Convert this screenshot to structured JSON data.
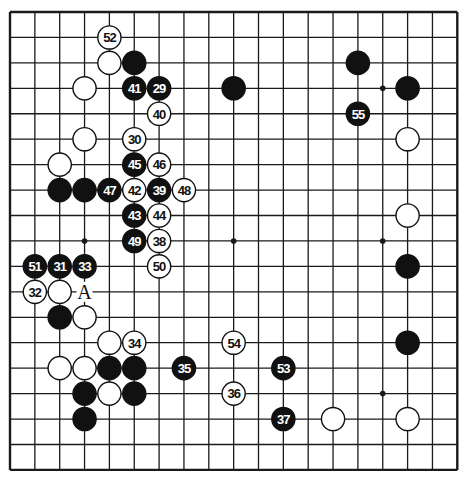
{
  "board": {
    "size": 19,
    "origin_x": 10,
    "origin_y": 12,
    "spacing_x": 24.85,
    "spacing_y": 25.44,
    "line_color": "#1a1a1a",
    "background": "#ffffff",
    "black_color": "#111111",
    "white_color": "#ffffff",
    "hoshi": [
      [
        3,
        3
      ],
      [
        9,
        3
      ],
      [
        15,
        3
      ],
      [
        3,
        9
      ],
      [
        9,
        9
      ],
      [
        15,
        9
      ],
      [
        3,
        15
      ],
      [
        9,
        15
      ],
      [
        15,
        15
      ]
    ]
  },
  "stones": [
    {
      "col": 4,
      "row": 1,
      "color": "white",
      "label": "52"
    },
    {
      "col": 4,
      "row": 2,
      "color": "white",
      "label": ""
    },
    {
      "col": 5,
      "row": 2,
      "color": "black",
      "label": ""
    },
    {
      "col": 3,
      "row": 3,
      "color": "white",
      "label": ""
    },
    {
      "col": 5,
      "row": 3,
      "color": "black",
      "label": "41"
    },
    {
      "col": 6,
      "row": 3,
      "color": "black",
      "label": "29"
    },
    {
      "col": 9,
      "row": 3,
      "color": "black",
      "label": ""
    },
    {
      "col": 6,
      "row": 4,
      "color": "white",
      "label": "40"
    },
    {
      "col": 3,
      "row": 5,
      "color": "white",
      "label": ""
    },
    {
      "col": 5,
      "row": 5,
      "color": "white",
      "label": "30"
    },
    {
      "col": 2,
      "row": 6,
      "color": "white",
      "label": ""
    },
    {
      "col": 5,
      "row": 6,
      "color": "black",
      "label": "45"
    },
    {
      "col": 6,
      "row": 6,
      "color": "white",
      "label": "46"
    },
    {
      "col": 2,
      "row": 7,
      "color": "black",
      "label": ""
    },
    {
      "col": 3,
      "row": 7,
      "color": "black",
      "label": ""
    },
    {
      "col": 4,
      "row": 7,
      "color": "black",
      "label": "47"
    },
    {
      "col": 5,
      "row": 7,
      "color": "white",
      "label": "42"
    },
    {
      "col": 6,
      "row": 7,
      "color": "black",
      "label": "39"
    },
    {
      "col": 7,
      "row": 7,
      "color": "white",
      "label": "48"
    },
    {
      "col": 5,
      "row": 8,
      "color": "black",
      "label": "43"
    },
    {
      "col": 6,
      "row": 8,
      "color": "white",
      "label": "44"
    },
    {
      "col": 5,
      "row": 9,
      "color": "black",
      "label": "49"
    },
    {
      "col": 6,
      "row": 9,
      "color": "white",
      "label": "38"
    },
    {
      "col": 1,
      "row": 10,
      "color": "black",
      "label": "51"
    },
    {
      "col": 2,
      "row": 10,
      "color": "black",
      "label": "31"
    },
    {
      "col": 3,
      "row": 10,
      "color": "black",
      "label": "33"
    },
    {
      "col": 6,
      "row": 10,
      "color": "white",
      "label": "50"
    },
    {
      "col": 1,
      "row": 11,
      "color": "white",
      "label": "32"
    },
    {
      "col": 2,
      "row": 11,
      "color": "white",
      "label": ""
    },
    {
      "col": 2,
      "row": 12,
      "color": "black",
      "label": ""
    },
    {
      "col": 3,
      "row": 12,
      "color": "white",
      "label": ""
    },
    {
      "col": 4,
      "row": 13,
      "color": "white",
      "label": ""
    },
    {
      "col": 5,
      "row": 13,
      "color": "white",
      "label": "34"
    },
    {
      "col": 9,
      "row": 13,
      "color": "white",
      "label": "54"
    },
    {
      "col": 2,
      "row": 14,
      "color": "white",
      "label": ""
    },
    {
      "col": 3,
      "row": 14,
      "color": "white",
      "label": ""
    },
    {
      "col": 4,
      "row": 14,
      "color": "black",
      "label": ""
    },
    {
      "col": 5,
      "row": 14,
      "color": "black",
      "label": ""
    },
    {
      "col": 7,
      "row": 14,
      "color": "black",
      "label": "35"
    },
    {
      "col": 11,
      "row": 14,
      "color": "black",
      "label": "53"
    },
    {
      "col": 3,
      "row": 15,
      "color": "black",
      "label": ""
    },
    {
      "col": 4,
      "row": 15,
      "color": "white",
      "label": ""
    },
    {
      "col": 5,
      "row": 15,
      "color": "black",
      "label": ""
    },
    {
      "col": 9,
      "row": 15,
      "color": "white",
      "label": "36"
    },
    {
      "col": 3,
      "row": 16,
      "color": "black",
      "label": ""
    },
    {
      "col": 11,
      "row": 16,
      "color": "black",
      "label": "37"
    },
    {
      "col": 13,
      "row": 16,
      "color": "white",
      "label": ""
    },
    {
      "col": 16,
      "row": 16,
      "color": "white",
      "label": ""
    },
    {
      "col": 14,
      "row": 2,
      "color": "black",
      "label": ""
    },
    {
      "col": 16,
      "row": 3,
      "color": "black",
      "label": ""
    },
    {
      "col": 14,
      "row": 4,
      "color": "black",
      "label": "55"
    },
    {
      "col": 16,
      "row": 5,
      "color": "white",
      "label": ""
    },
    {
      "col": 16,
      "row": 8,
      "color": "white",
      "label": ""
    },
    {
      "col": 16,
      "row": 10,
      "color": "black",
      "label": ""
    },
    {
      "col": 16,
      "row": 13,
      "color": "black",
      "label": ""
    }
  ],
  "marks": [
    {
      "col": 3,
      "row": 11,
      "label": "A"
    }
  ]
}
